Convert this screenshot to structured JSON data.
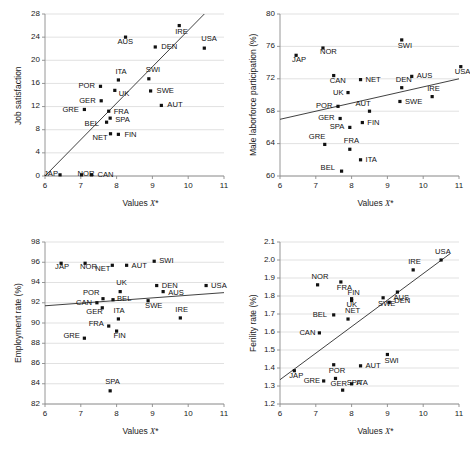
{
  "figure": {
    "panel_count": 4,
    "shared_xlabel": "Values X*",
    "marker_style": "filled-square",
    "grid": "horizontal-gridlines"
  },
  "chart_data": [
    {
      "type": "scatter",
      "title": "",
      "xlabel": "Values X*",
      "ylabel": "Job satisfaction",
      "xlim": [
        6,
        11
      ],
      "ylim": [
        0,
        28
      ],
      "xticks": [
        "6",
        "7",
        "8",
        "9",
        "10",
        "11"
      ],
      "yticks": [
        "0",
        "4",
        "8",
        "12",
        "16",
        "20",
        "24",
        "28"
      ],
      "grid": "horizontal",
      "legend": "none",
      "trendline": {
        "x0": 6.0,
        "y0": 0.0,
        "x1": 10.45,
        "y1": 28.0
      },
      "points": [
        {
          "label": "JAP",
          "x": 6.42,
          "y": 0.2,
          "lx": -16,
          "ly": -1
        },
        {
          "label": "NOR",
          "x": 7.02,
          "y": 0.2,
          "lx": -4,
          "ly": -1
        },
        {
          "label": "CAN",
          "x": 7.3,
          "y": 0.2,
          "lx": 6,
          "ly": 0
        },
        {
          "label": "GRE",
          "x": 7.1,
          "y": 11.5,
          "lx": -22,
          "ly": 1
        },
        {
          "label": "GER",
          "x": 7.57,
          "y": 13.0,
          "lx": -22,
          "ly": 0
        },
        {
          "label": "POR",
          "x": 7.55,
          "y": 15.5,
          "lx": -22,
          "ly": 0
        },
        {
          "label": "BEL",
          "x": 7.72,
          "y": 9.3,
          "lx": -22,
          "ly": 2
        },
        {
          "label": "NET",
          "x": 7.83,
          "y": 7.3,
          "lx": -18,
          "ly": 4
        },
        {
          "label": "SPA",
          "x": 7.82,
          "y": 10.0,
          "lx": 5,
          "ly": 2
        },
        {
          "label": "FRA",
          "x": 7.78,
          "y": 11.2,
          "lx": 5,
          "ly": 1
        },
        {
          "label": "UK",
          "x": 7.95,
          "y": 14.8,
          "lx": 4,
          "ly": 4
        },
        {
          "label": "ITA",
          "x": 8.05,
          "y": 16.6,
          "lx": -3,
          "ly": -8
        },
        {
          "label": "FIN",
          "x": 8.05,
          "y": 7.2,
          "lx": 6,
          "ly": 1
        },
        {
          "label": "AUS",
          "x": 8.25,
          "y": 24.0,
          "lx": -8,
          "ly": 5
        },
        {
          "label": "SWI",
          "x": 8.9,
          "y": 16.8,
          "lx": -3,
          "ly": -9
        },
        {
          "label": "SWE",
          "x": 8.95,
          "y": 14.7,
          "lx": 6,
          "ly": 0
        },
        {
          "label": "DEN",
          "x": 9.08,
          "y": 22.3,
          "lx": 6,
          "ly": 0
        },
        {
          "label": "AUT",
          "x": 9.25,
          "y": 12.2,
          "lx": 6,
          "ly": 0
        },
        {
          "label": "IRE",
          "x": 9.75,
          "y": 26.0,
          "lx": -4,
          "ly": 6
        },
        {
          "label": "USA",
          "x": 10.45,
          "y": 22.1,
          "lx": -3,
          "ly": -9
        }
      ]
    },
    {
      "type": "scatter",
      "title": "",
      "xlabel": "Values X*",
      "ylabel": "Male laborforce participation (%)",
      "xlim": [
        6,
        11
      ],
      "ylim": [
        60,
        80
      ],
      "xticks": [
        "6",
        "7",
        "8",
        "9",
        "10",
        "11"
      ],
      "yticks": [
        "60",
        "64",
        "68",
        "72",
        "76",
        "80"
      ],
      "grid": "horizontal",
      "legend": "none",
      "trendline": {
        "x0": 6.0,
        "y0": 67.0,
        "x1": 11.0,
        "y1": 72.0
      },
      "points": [
        {
          "label": "JAP",
          "x": 6.45,
          "y": 74.9,
          "lx": -4,
          "ly": 5
        },
        {
          "label": "NOR",
          "x": 7.2,
          "y": 75.8,
          "lx": -3,
          "ly": 4
        },
        {
          "label": "CAN",
          "x": 7.5,
          "y": 72.4,
          "lx": -4,
          "ly": 5
        },
        {
          "label": "GRE",
          "x": 7.25,
          "y": 63.9,
          "lx": -16,
          "ly": -7
        },
        {
          "label": "POR",
          "x": 7.62,
          "y": 68.6,
          "lx": -22,
          "ly": 0
        },
        {
          "label": "GER",
          "x": 7.68,
          "y": 67.1,
          "lx": -22,
          "ly": 0
        },
        {
          "label": "BEL",
          "x": 7.72,
          "y": 60.6,
          "lx": -21,
          "ly": -3
        },
        {
          "label": "SPA",
          "x": 7.95,
          "y": 66.0,
          "lx": -20,
          "ly": 0
        },
        {
          "label": "FRA",
          "x": 7.95,
          "y": 63.3,
          "lx": -6,
          "ly": -8
        },
        {
          "label": "UK",
          "x": 7.9,
          "y": 70.3,
          "lx": -15,
          "ly": 0
        },
        {
          "label": "ITA",
          "x": 8.25,
          "y": 62.0,
          "lx": 5,
          "ly": 0
        },
        {
          "label": "NET",
          "x": 8.25,
          "y": 71.9,
          "lx": 5,
          "ly": 0
        },
        {
          "label": "AUT",
          "x": 8.5,
          "y": 68.0,
          "lx": -14,
          "ly": -7
        },
        {
          "label": "FIN",
          "x": 8.3,
          "y": 66.6,
          "lx": 5,
          "ly": 0
        },
        {
          "label": "SWI",
          "x": 9.4,
          "y": 76.8,
          "lx": -4,
          "ly": 6
        },
        {
          "label": "DEN",
          "x": 9.4,
          "y": 70.9,
          "lx": -6,
          "ly": -8
        },
        {
          "label": "SWE",
          "x": 9.35,
          "y": 69.2,
          "lx": 5,
          "ly": 1
        },
        {
          "label": "AUS",
          "x": 9.68,
          "y": 72.3,
          "lx": 5,
          "ly": 0
        },
        {
          "label": "IRE",
          "x": 10.25,
          "y": 69.8,
          "lx": -5,
          "ly": -8
        },
        {
          "label": "USA",
          "x": 11.05,
          "y": 73.5,
          "lx": -6,
          "ly": 5
        }
      ]
    },
    {
      "type": "scatter",
      "title": "",
      "xlabel": "Values X*",
      "ylabel": "Employment rate (%)",
      "xlim": [
        6,
        11
      ],
      "ylim": [
        82,
        98
      ],
      "xticks": [
        "6",
        "7",
        "8",
        "9",
        "10",
        "11"
      ],
      "yticks": [
        "82",
        "84",
        "86",
        "88",
        "90",
        "92",
        "94",
        "96",
        "98"
      ],
      "grid": "horizontal",
      "legend": "none",
      "trendline": {
        "x0": 6.0,
        "y0": 91.7,
        "x1": 11.0,
        "y1": 93.0
      },
      "points": [
        {
          "label": "JAP",
          "x": 6.45,
          "y": 95.9,
          "lx": -6,
          "ly": 4
        },
        {
          "label": "NOR",
          "x": 7.12,
          "y": 95.9,
          "lx": -5,
          "ly": 4
        },
        {
          "label": "GRE",
          "x": 7.1,
          "y": 88.5,
          "lx": -21,
          "ly": -2
        },
        {
          "label": "CAN",
          "x": 7.45,
          "y": 92.0,
          "lx": -21,
          "ly": 0
        },
        {
          "label": "GER",
          "x": 7.6,
          "y": 91.5,
          "lx": -16,
          "ly": 4
        },
        {
          "label": "POR",
          "x": 7.62,
          "y": 92.4,
          "lx": -20,
          "ly": -6
        },
        {
          "label": "FRA",
          "x": 7.78,
          "y": 89.7,
          "lx": -20,
          "ly": -2
        },
        {
          "label": "SPA",
          "x": 7.82,
          "y": 83.3,
          "lx": -5,
          "ly": -9
        },
        {
          "label": "NET",
          "x": 7.88,
          "y": 95.7,
          "lx": -17,
          "ly": 4
        },
        {
          "label": "BEL",
          "x": 7.9,
          "y": 92.3,
          "lx": 4,
          "ly": -1
        },
        {
          "label": "ITA",
          "x": 8.05,
          "y": 90.4,
          "lx": -5,
          "ly": -8
        },
        {
          "label": "FIN",
          "x": 8.0,
          "y": 89.2,
          "lx": -3,
          "ly": 5
        },
        {
          "label": "UK",
          "x": 8.1,
          "y": 93.1,
          "lx": -4,
          "ly": -9
        },
        {
          "label": "AUT",
          "x": 8.28,
          "y": 95.7,
          "lx": 5,
          "ly": 1
        },
        {
          "label": "SWE",
          "x": 8.88,
          "y": 92.2,
          "lx": -3,
          "ly": 5
        },
        {
          "label": "SWI",
          "x": 9.05,
          "y": 96.1,
          "lx": 5,
          "ly": 0
        },
        {
          "label": "DEN",
          "x": 9.12,
          "y": 93.7,
          "lx": 5,
          "ly": 0
        },
        {
          "label": "AUS",
          "x": 9.3,
          "y": 93.1,
          "lx": 5,
          "ly": 1
        },
        {
          "label": "IRE",
          "x": 9.78,
          "y": 90.5,
          "lx": -5,
          "ly": -8
        },
        {
          "label": "USA",
          "x": 10.5,
          "y": 93.7,
          "lx": 5,
          "ly": 0
        }
      ]
    },
    {
      "type": "scatter",
      "title": "",
      "xlabel": "Values X*",
      "ylabel": "Ferility rate (%)",
      "xlim": [
        6,
        11
      ],
      "ylim": [
        1.2,
        2.1
      ],
      "xticks": [
        "6",
        "7",
        "8",
        "9",
        "10",
        "11"
      ],
      "yticks": [
        "1.2",
        "1.3",
        "1.4",
        "1.5",
        "1.6",
        "1.7",
        "1.8",
        "1.9",
        "2.0",
        "2.1"
      ],
      "grid": "horizontal",
      "legend": "none",
      "trendline": {
        "x0": 6.0,
        "y0": 1.335,
        "x1": 10.75,
        "y1": 2.035
      },
      "points": [
        {
          "label": "JAP",
          "x": 6.4,
          "y": 1.385,
          "lx": -5,
          "ly": 5
        },
        {
          "label": "CAN",
          "x": 7.1,
          "y": 1.595,
          "lx": -20,
          "ly": 0
        },
        {
          "label": "NOR",
          "x": 7.05,
          "y": 1.862,
          "lx": -6,
          "ly": -8
        },
        {
          "label": "GRE",
          "x": 7.22,
          "y": 1.328,
          "lx": -20,
          "ly": 0
        },
        {
          "label": "BEL",
          "x": 7.5,
          "y": 1.695,
          "lx": -21,
          "ly": 0
        },
        {
          "label": "POR",
          "x": 7.5,
          "y": 1.418,
          "lx": -5,
          "ly": 6
        },
        {
          "label": "GER",
          "x": 7.55,
          "y": 1.342,
          "lx": -5,
          "ly": 6
        },
        {
          "label": "FRA",
          "x": 7.7,
          "y": 1.878,
          "lx": -4,
          "ly": 6
        },
        {
          "label": "SPA",
          "x": 7.75,
          "y": 1.277,
          "lx": 4,
          "ly": -7
        },
        {
          "label": "NET",
          "x": 7.9,
          "y": 1.672,
          "lx": -3,
          "ly": -8
        },
        {
          "label": "UK",
          "x": 8.0,
          "y": 1.785,
          "lx": -5,
          "ly": 6
        },
        {
          "label": "FIN",
          "x": 8.0,
          "y": 1.775,
          "lx": -4,
          "ly": -8
        },
        {
          "label": "ITA",
          "x": 8.0,
          "y": 1.312,
          "lx": 5,
          "ly": -1
        },
        {
          "label": "AUT",
          "x": 8.25,
          "y": 1.412,
          "lx": 5,
          "ly": 0
        },
        {
          "label": "SWE",
          "x": 8.88,
          "y": 1.79,
          "lx": -5,
          "ly": 6
        },
        {
          "label": "SWI",
          "x": 9.0,
          "y": 1.475,
          "lx": -3,
          "ly": 6
        },
        {
          "label": "DEN",
          "x": 9.05,
          "y": 1.765,
          "lx": 5,
          "ly": -1
        },
        {
          "label": "AUS",
          "x": 9.28,
          "y": 1.822,
          "lx": -4,
          "ly": 6
        },
        {
          "label": "IRE",
          "x": 9.72,
          "y": 1.945,
          "lx": -5,
          "ly": -8
        },
        {
          "label": "USA",
          "x": 10.5,
          "y": 2.0,
          "lx": -6,
          "ly": -8
        }
      ]
    }
  ]
}
